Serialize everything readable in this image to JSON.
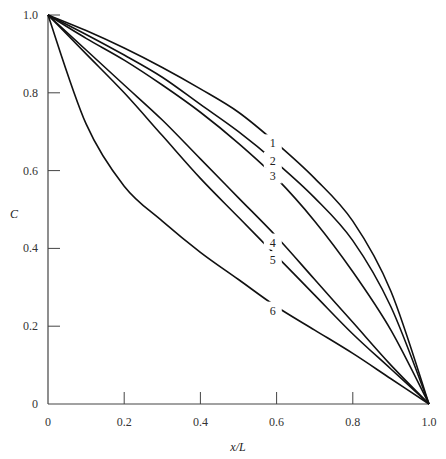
{
  "chart_data": {
    "type": "line",
    "title": "",
    "xlabel": "x/L",
    "ylabel": "C",
    "xlim": [
      0,
      1.0
    ],
    "ylim": [
      0,
      1.0
    ],
    "grid": false,
    "legend": "inline numeric labels on curves",
    "x_ticks": [
      "0",
      "0.2",
      "0.4",
      "0.6",
      "0.8",
      "1.0"
    ],
    "y_ticks": [
      "0",
      "0.2",
      "0.4",
      "0.6",
      "0.8",
      "1.0"
    ],
    "x": [
      0,
      0.1,
      0.2,
      0.3,
      0.4,
      0.5,
      0.6,
      0.7,
      0.8,
      0.9,
      1.0
    ],
    "series": [
      {
        "name": "1",
        "values": [
          1.0,
          0.96,
          0.915,
          0.865,
          0.81,
          0.75,
          0.67,
          0.58,
          0.47,
          0.29,
          0.0
        ]
      },
      {
        "name": "2",
        "values": [
          1.0,
          0.95,
          0.897,
          0.84,
          0.77,
          0.7,
          0.62,
          0.53,
          0.42,
          0.25,
          0.0
        ]
      },
      {
        "name": "3",
        "values": [
          1.0,
          0.94,
          0.884,
          0.82,
          0.75,
          0.67,
          0.58,
          0.47,
          0.34,
          0.19,
          0.0
        ]
      },
      {
        "name": "4",
        "values": [
          1.0,
          0.91,
          0.82,
          0.73,
          0.63,
          0.53,
          0.43,
          0.32,
          0.21,
          0.1,
          0.0
        ]
      },
      {
        "name": "5",
        "values": [
          1.0,
          0.9,
          0.8,
          0.69,
          0.58,
          0.48,
          0.38,
          0.28,
          0.18,
          0.09,
          0.0
        ]
      },
      {
        "name": "6",
        "values": [
          1.0,
          0.72,
          0.56,
          0.47,
          0.39,
          0.32,
          0.25,
          0.19,
          0.13,
          0.065,
          0.0
        ]
      }
    ],
    "curve_labels": [
      {
        "text": "1",
        "x": 0.59,
        "y": 0.67
      },
      {
        "text": "2",
        "x": 0.59,
        "y": 0.625
      },
      {
        "text": "3",
        "x": 0.59,
        "y": 0.585
      },
      {
        "text": "4",
        "x": 0.59,
        "y": 0.415
      },
      {
        "text": "5",
        "x": 0.59,
        "y": 0.37
      },
      {
        "text": "6",
        "x": 0.59,
        "y": 0.24
      }
    ]
  }
}
